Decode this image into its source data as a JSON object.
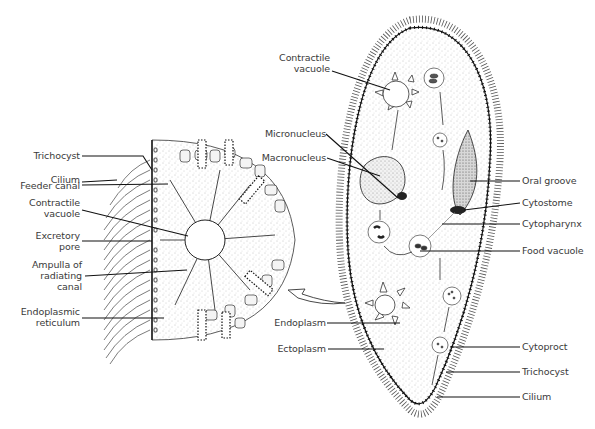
{
  "diagram": {
    "colors": {
      "line": "#1a1a1a",
      "stipple": "#9a9a9a",
      "background": "#ffffff",
      "text": "#3a3a3a"
    },
    "cross_section_labels": [
      {
        "id": "trichocyst",
        "text": "Trichocyst"
      },
      {
        "id": "cilium",
        "text": "Cilium"
      },
      {
        "id": "feeder-canal",
        "text": "Feeder canal"
      },
      {
        "id": "contractile-vacuole",
        "line1": "Contractile",
        "line2": "vacuole"
      },
      {
        "id": "excretory-pore",
        "line1": "Excretory",
        "line2": "pore"
      },
      {
        "id": "ampulla",
        "line1": "Ampulla of",
        "line2": "radiating",
        "line3": "canal"
      },
      {
        "id": "endoplasmic-reticulum",
        "line1": "Endoplasmic",
        "line2": "reticulum"
      }
    ],
    "organism_left_labels": [
      {
        "id": "contractile-vacuole",
        "line1": "Contractile",
        "line2": "vacuole"
      },
      {
        "id": "micronucleus",
        "text": "Micronucleus"
      },
      {
        "id": "macronucleus",
        "text": "Macronucleus"
      },
      {
        "id": "endoplasm",
        "text": "Endoplasm"
      },
      {
        "id": "ectoplasm",
        "text": "Ectoplasm"
      }
    ],
    "organism_right_labels": [
      {
        "id": "oral-groove",
        "text": "Oral groove"
      },
      {
        "id": "cytostome",
        "text": "Cytostome"
      },
      {
        "id": "cytopharynx",
        "text": "Cytopharynx"
      },
      {
        "id": "food-vacuole",
        "text": "Food vacuole"
      },
      {
        "id": "cytoproct",
        "text": "Cytoproct"
      },
      {
        "id": "trichocyst",
        "text": "Trichocyst"
      },
      {
        "id": "cilium",
        "text": "Cilium"
      }
    ]
  }
}
